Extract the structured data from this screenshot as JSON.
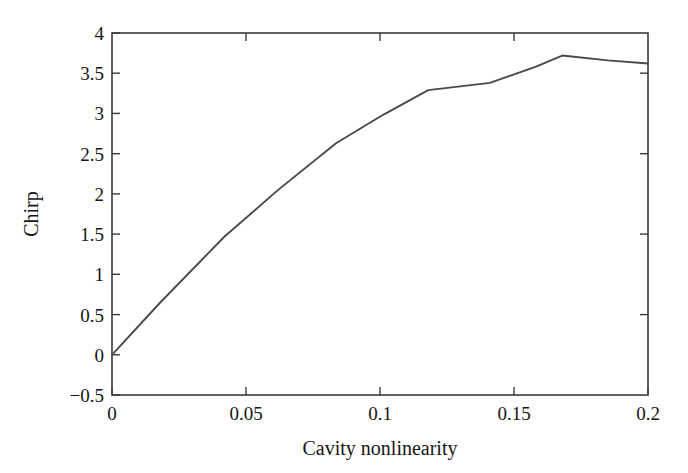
{
  "chart_data": {
    "type": "line",
    "title": "",
    "xlabel": "Cavity nonlinearity",
    "ylabel": "Chirp",
    "xlim": [
      0,
      0.2
    ],
    "ylim": [
      -0.5,
      4
    ],
    "xticks": [
      0,
      0.05,
      0.1,
      0.15,
      0.2
    ],
    "xtick_labels": [
      "0",
      "0.05",
      "0.1",
      "0.15",
      "0.2"
    ],
    "yticks": [
      -0.5,
      0,
      0.5,
      1,
      1.5,
      2,
      2.5,
      3,
      3.5,
      4
    ],
    "ytick_labels": [
      "-0.5",
      "0",
      "0.5",
      "1",
      "1.5",
      "2",
      "2.5",
      "3",
      "3.5",
      "4"
    ],
    "grid": false,
    "legend": null,
    "series": [
      {
        "name": "Chirp vs cavity nonlinearity",
        "color": "#4a4a4a",
        "x": [
          0.0,
          0.018,
          0.042,
          0.062,
          0.0836,
          0.101,
          0.118,
          0.141,
          0.158,
          0.168,
          0.185,
          0.2
        ],
        "y": [
          0.0,
          0.65,
          1.47,
          2.05,
          2.63,
          2.98,
          3.29,
          3.38,
          3.58,
          3.72,
          3.66,
          3.62
        ]
      }
    ]
  },
  "axes": {
    "x_axis_title": "Cavity nonlinearity",
    "y_axis_title": "Chirp"
  },
  "tick_text": {
    "y": {
      "t4": "4",
      "t35": "3.5",
      "t3": "3",
      "t25": "2.5",
      "t2": "2",
      "t15": "1.5",
      "t1": "1",
      "t05": "0.5",
      "t0": "0",
      "tm05": "−0.5"
    },
    "x": {
      "t0": "0",
      "t005": "0.05",
      "t01": "0.1",
      "t015": "0.15",
      "t02": "0.2"
    }
  },
  "colors": {
    "line": "#4a4a4a",
    "frame": "#3b3b3b",
    "text": "#151515",
    "background": "#ffffff"
  }
}
